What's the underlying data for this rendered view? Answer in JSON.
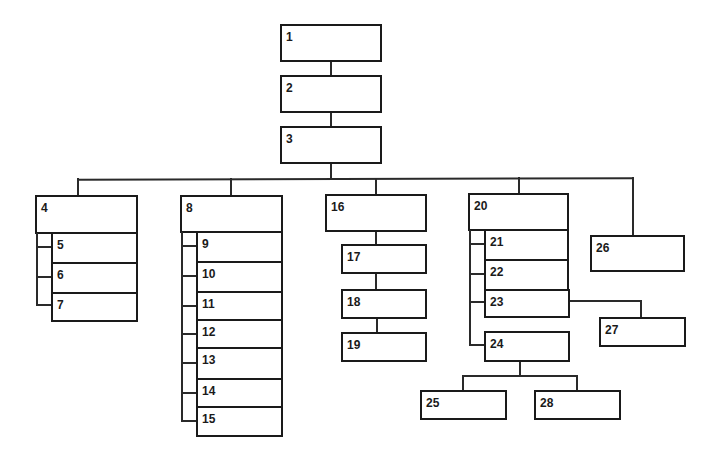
{
  "diagram": {
    "type": "hierarchy-tree",
    "nodes": [
      {
        "id": "1",
        "label": "1"
      },
      {
        "id": "2",
        "label": "2"
      },
      {
        "id": "3",
        "label": "3"
      },
      {
        "id": "4",
        "label": "4"
      },
      {
        "id": "5",
        "label": "5"
      },
      {
        "id": "6",
        "label": "6"
      },
      {
        "id": "7",
        "label": "7"
      },
      {
        "id": "8",
        "label": "8"
      },
      {
        "id": "9",
        "label": "9"
      },
      {
        "id": "10",
        "label": "10"
      },
      {
        "id": "11",
        "label": "11"
      },
      {
        "id": "12",
        "label": "12"
      },
      {
        "id": "13",
        "label": "13"
      },
      {
        "id": "14",
        "label": "14"
      },
      {
        "id": "15",
        "label": "15"
      },
      {
        "id": "16",
        "label": "16"
      },
      {
        "id": "17",
        "label": "17"
      },
      {
        "id": "18",
        "label": "18"
      },
      {
        "id": "19",
        "label": "19"
      },
      {
        "id": "20",
        "label": "20"
      },
      {
        "id": "21",
        "label": "21"
      },
      {
        "id": "22",
        "label": "22"
      },
      {
        "id": "23",
        "label": "23"
      },
      {
        "id": "24",
        "label": "24"
      },
      {
        "id": "25",
        "label": "25"
      },
      {
        "id": "26",
        "label": "26"
      },
      {
        "id": "27",
        "label": "27"
      },
      {
        "id": "28",
        "label": "28"
      }
    ],
    "edges": [
      [
        "1",
        "2"
      ],
      [
        "2",
        "3"
      ],
      [
        "3",
        "4"
      ],
      [
        "3",
        "8"
      ],
      [
        "3",
        "16"
      ],
      [
        "3",
        "20"
      ],
      [
        "3",
        "26"
      ],
      [
        "4",
        "5"
      ],
      [
        "4",
        "6"
      ],
      [
        "4",
        "7"
      ],
      [
        "8",
        "9"
      ],
      [
        "8",
        "10"
      ],
      [
        "8",
        "11"
      ],
      [
        "8",
        "12"
      ],
      [
        "8",
        "13"
      ],
      [
        "8",
        "14"
      ],
      [
        "8",
        "15"
      ],
      [
        "16",
        "17"
      ],
      [
        "17",
        "18"
      ],
      [
        "18",
        "19"
      ],
      [
        "20",
        "21"
      ],
      [
        "20",
        "22"
      ],
      [
        "20",
        "23"
      ],
      [
        "20",
        "24"
      ],
      [
        "23",
        "27"
      ],
      [
        "24",
        "25"
      ],
      [
        "24",
        "28"
      ]
    ]
  },
  "labels": {
    "n1": "1",
    "n2": "2",
    "n3": "3",
    "n4": "4",
    "n5": "5",
    "n6": "6",
    "n7": "7",
    "n8": "8",
    "n9": "9",
    "n10": "10",
    "n11": "11",
    "n12": "12",
    "n13": "13",
    "n14": "14",
    "n15": "15",
    "n16": "16",
    "n17": "17",
    "n18": "18",
    "n19": "19",
    "n20": "20",
    "n21": "21",
    "n22": "22",
    "n23": "23",
    "n24": "24",
    "n25": "25",
    "n26": "26",
    "n27": "27",
    "n28": "28"
  }
}
